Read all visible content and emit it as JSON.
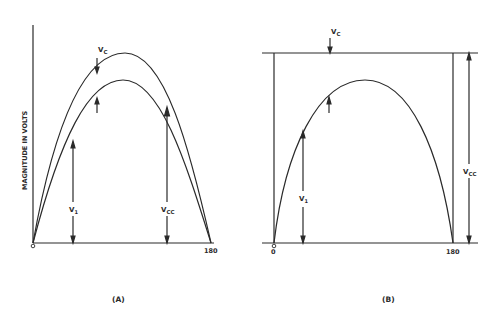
{
  "panels": [
    {
      "id": "A",
      "caption": "(A)",
      "y_axis_label": "MAGNITUDE IN VOLTS",
      "x_ticks": [
        "0",
        "180"
      ],
      "labels": {
        "vc": "V",
        "vc_sub": "C",
        "v1": "V",
        "v1_sub": "1",
        "vcc": "V",
        "vcc_sub": "CC"
      },
      "curves": [
        "collector voltage (Vc)",
        "input voltage (V1)"
      ]
    },
    {
      "id": "B",
      "caption": "(B)",
      "x_ticks": [
        "0",
        "180"
      ],
      "labels": {
        "vc": "V",
        "vc_sub": "C",
        "v1": "V",
        "v1_sub": "1",
        "vcc": "V",
        "vcc_sub": "CC"
      },
      "curves": [
        "input voltage (V1)"
      ]
    }
  ],
  "colors": {
    "ink": "#2a2a2a",
    "background": "#ffffff"
  }
}
